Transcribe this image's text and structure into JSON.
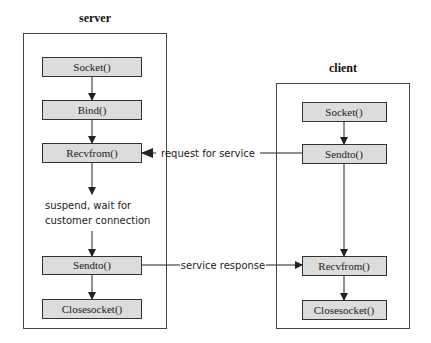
{
  "server": {
    "title": "server",
    "steps": [
      "Socket()",
      "Bind()",
      "Recvfrom()",
      "Sendto()",
      "Closesocket()"
    ],
    "note_line1": "suspend, wait for",
    "note_line2": "customer connection"
  },
  "client": {
    "title": "client",
    "steps": [
      "Socket()",
      "Sendto()",
      "Recvfrom()",
      "Closesocket()"
    ]
  },
  "messages": {
    "request": "request for service",
    "response": "service response"
  },
  "colors": {
    "box_fill": "#dcdcdc",
    "stroke": "#333333"
  }
}
